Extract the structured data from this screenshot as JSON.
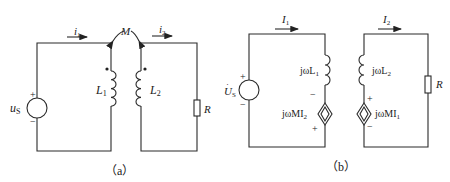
{
  "diagram_a": {
    "caption": "（a）",
    "source_label": "u",
    "source_sub": "S",
    "plus": "+",
    "minus": "−",
    "current1": "i",
    "current1_sub": "1",
    "current2": "i",
    "current2_sub": "2",
    "mutual": "M",
    "inductor1": "L",
    "inductor1_sub": "1",
    "inductor2": "L",
    "inductor2_sub": "2",
    "resistor": "R"
  },
  "diagram_b": {
    "caption": "（b）",
    "source_label": "U",
    "source_sub": "S",
    "plus": "+",
    "minus": "−",
    "current1": "I",
    "current1_sub": "1",
    "current2": "I",
    "current2_sub": "2",
    "inductor1": "jωL",
    "inductor1_sub": "1",
    "inductor2": "jωL",
    "inductor2_sub": "2",
    "dep_source1": "jωMI",
    "dep_source1_sub": "2",
    "dep_source2": "jωMI",
    "dep_source2_sub": "1",
    "resistor": "R"
  }
}
